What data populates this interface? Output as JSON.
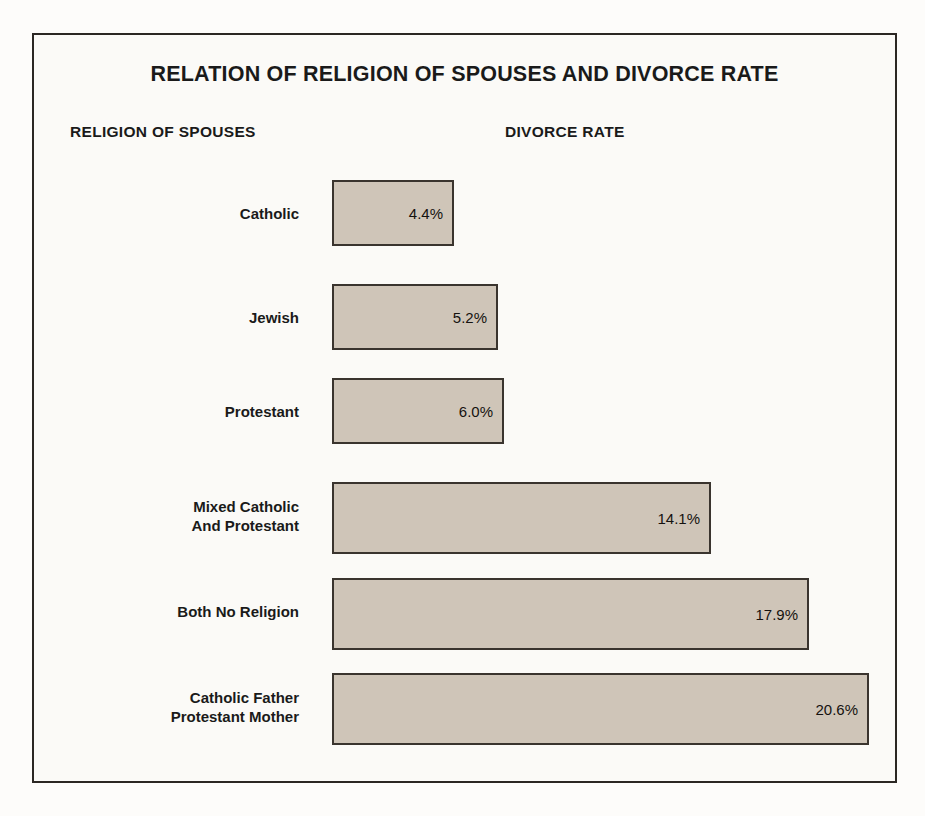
{
  "chart": {
    "title": "RELATION OF RELIGION OF SPOUSES AND DIVORCE RATE",
    "category_header": "RELIGION OF SPOUSES",
    "value_header": "DIVORCE RATE"
  },
  "chart_data": {
    "type": "bar",
    "orientation": "horizontal",
    "title": "RELATION OF RELIGION OF SPOUSES AND DIVORCE RATE",
    "xlabel": "DIVORCE RATE",
    "ylabel": "RELIGION OF SPOUSES",
    "grid": false,
    "legend": false,
    "value_suffix": "%",
    "categories": [
      "Catholic",
      "Jewish",
      "Protestant",
      "Mixed Catholic\nAnd Protestant",
      "Both No Religion",
      "Catholic Father\nProtestant Mother"
    ],
    "values": [
      4.4,
      5.2,
      6.0,
      14.1,
      17.9,
      20.6
    ],
    "bars": [
      {
        "label": "Catholic",
        "value": 4.4,
        "value_label": "4.4%",
        "bar_width_px": 122,
        "bar_top_px": 180,
        "bar_height_px": 66,
        "label_top_px": 204
      },
      {
        "label": "Jewish",
        "value": 5.2,
        "value_label": "5.2%",
        "bar_width_px": 166,
        "bar_top_px": 284,
        "bar_height_px": 66,
        "label_top_px": 308
      },
      {
        "label": "Protestant",
        "value": 6.0,
        "value_label": "6.0%",
        "bar_width_px": 172,
        "bar_top_px": 378,
        "bar_height_px": 66,
        "label_top_px": 402
      },
      {
        "label": "Mixed Catholic\nAnd Protestant",
        "value": 14.1,
        "value_label": "14.1%",
        "bar_width_px": 379,
        "bar_top_px": 482,
        "bar_height_px": 72,
        "label_top_px": 497
      },
      {
        "label": "Both No Religion",
        "value": 17.9,
        "value_label": "17.9%",
        "bar_width_px": 477,
        "bar_top_px": 578,
        "bar_height_px": 72,
        "label_top_px": 602
      },
      {
        "label": "Catholic Father\nProtestant Mother",
        "value": 20.6,
        "value_label": "20.6%",
        "bar_width_px": 537,
        "bar_top_px": 673,
        "bar_height_px": 72,
        "label_top_px": 688
      }
    ],
    "colors": {
      "bar_fill": "#cfc5b8",
      "bar_border": "#3a342e",
      "frame": "#2b2723",
      "background": "#fbfaf7",
      "text": "#1a1a1a"
    }
  }
}
